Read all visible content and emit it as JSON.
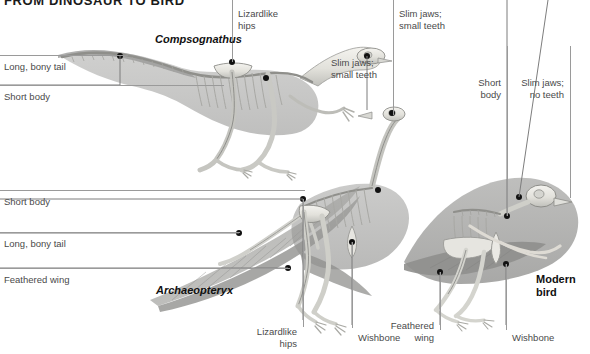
{
  "figure": {
    "title": "FROM DINOSAUR TO BIRD",
    "width": 590,
    "height": 354,
    "background": "#ffffff",
    "line_color": "#9a9a9a",
    "label_color": "#4a4a4a",
    "skeleton_light": "#efeee9",
    "skeleton_mid": "#b9b9b6",
    "silhouette": "#8f8f8f"
  },
  "species": [
    {
      "id": "compsognathus",
      "name": "Compsognathus",
      "style": "bold-italic"
    },
    {
      "id": "archaeopteryx",
      "name": "Archaeopteryx",
      "style": "bold-italic"
    },
    {
      "id": "modern-bird",
      "name": "Modern\nbird",
      "style": "bold"
    }
  ],
  "labels": {
    "comp_long_tail": "Long, bony tail",
    "comp_short_body": "Short body",
    "comp_lizardlike_hips": "Lizardlike\nhips",
    "comp_slim_jaws": "Slim jaws;\nsmall teeth",
    "arch_slim_jaws": "Slim jaws;\nsmall teeth",
    "arch_short_body": "Short body",
    "arch_long_tail": "Long, bony tail",
    "arch_feathered_wing": "Feathered wing",
    "arch_lizardlike_hips": "Lizardlike\nhips",
    "arch_wishbone": "Wishbone",
    "bird_short_body": "Short\nbody",
    "bird_slim_jaws": "Slim jaws;\nno teeth",
    "bird_feathered_wing": "Feathered\nwing",
    "bird_wishbone": "Wishbone"
  }
}
